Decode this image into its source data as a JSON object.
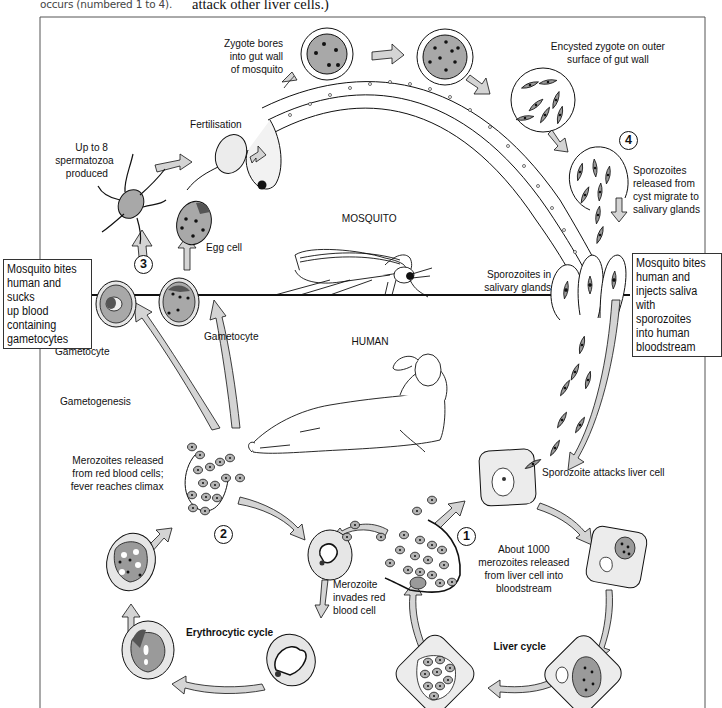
{
  "captions": {
    "left": "occurs (numbered 1 to 4).",
    "right": "attack other liver cells.)"
  },
  "regions": {
    "mosquito": "MOSQUITO",
    "human": "HUMAN"
  },
  "stages": [
    {
      "number": "1",
      "label": "About 1000\nmerozoites released\nfrom liver cell into\nbloodstream"
    },
    {
      "number": "2",
      "label": "Merozoites released\nfrom red blood cells;\nfever reaches climax"
    },
    {
      "number": "3",
      "label": "Mosquito bites\nhuman and sucks\nup blood\ncontaining\ngametocytes"
    },
    {
      "number": "4",
      "label": "Sporozoites\nreleased from\ncyst migrate to\nsalivary glands"
    }
  ],
  "labels": {
    "zygote_bores": "Zygote bores\ninto gut wall\nof mosquito",
    "fertilisation": "Fertilisation",
    "spermatozoa": "Up to 8\nspermatozoa\nproduced",
    "egg_cell": "Egg cell",
    "encysted_zygote": "Encysted zygote on outer\nsurface of gut wall",
    "sporozoites_in_glands": "Sporozoites in\nsalivary glands",
    "mosquito_injects": "Mosquito bites\nhuman and\ninjects saliva\nwith sporozoites\ninto human\nbloodstream",
    "gametocyte_left": "Gametocyte",
    "gametocyte_right": "Gametocyte",
    "gametogenesis": "Gametogenesis",
    "sporozoite_attacks": "Sporozoite attacks liver cell",
    "merozoite_invades": "Merozoite\ninvades red\nblood cell",
    "erythrocytic_cycle": "Erythrocytic cycle",
    "liver_cycle": "Liver cycle"
  },
  "colors": {
    "line": "#111111",
    "arrow_fill": "#d4d4d4",
    "cell_fill": "#e6e6e6",
    "parasite_fill": "#9a9a9a",
    "dark_fill": "#555555"
  }
}
